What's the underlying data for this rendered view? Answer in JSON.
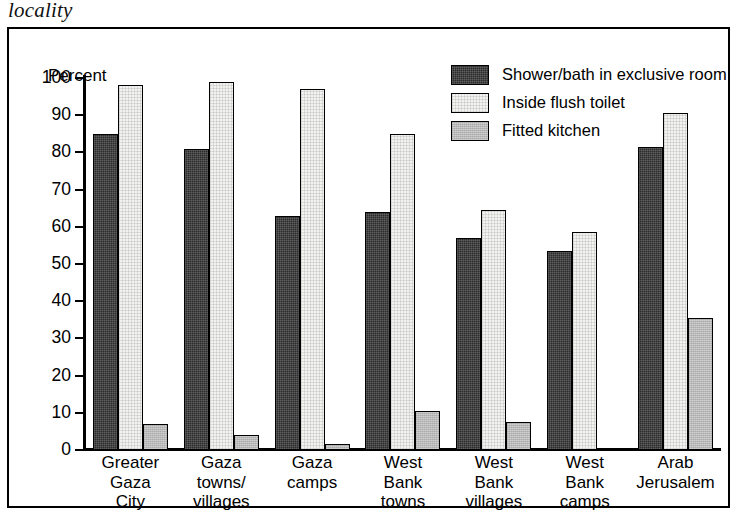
{
  "title_fragment": "locality",
  "axis": {
    "y_caption": "Percent",
    "y_ticks": [
      "100",
      "90",
      "80",
      "70",
      "60",
      "50",
      "40",
      "30",
      "20",
      "10",
      "0"
    ]
  },
  "legend": {
    "items": [
      {
        "label": "Shower/bath in exclusive room",
        "swatch": "dark"
      },
      {
        "label": "Inside flush toilet",
        "swatch": "white"
      },
      {
        "label": "Fitted kitchen",
        "swatch": "grey"
      }
    ]
  },
  "categories": [
    {
      "lines": [
        "Greater",
        "Gaza",
        "City"
      ]
    },
    {
      "lines": [
        "Gaza",
        "towns/",
        "villages"
      ]
    },
    {
      "lines": [
        "Gaza",
        "camps"
      ]
    },
    {
      "lines": [
        "West",
        "Bank",
        "towns"
      ]
    },
    {
      "lines": [
        "West",
        "Bank",
        "villages"
      ]
    },
    {
      "lines": [
        "West",
        "Bank",
        "camps"
      ]
    },
    {
      "lines": [
        "Arab",
        "Jerusalem"
      ]
    }
  ],
  "chart_data": {
    "type": "bar",
    "title": "locality",
    "xlabel": "",
    "ylabel": "Percent",
    "ylim": [
      0,
      100
    ],
    "ytick_step": 10,
    "grid": false,
    "legend_position": "top-right",
    "categories": [
      "Greater Gaza City",
      "Gaza towns/villages",
      "Gaza camps",
      "West Bank towns",
      "West Bank villages",
      "West Bank camps",
      "Arab Jerusalem"
    ],
    "series": [
      {
        "name": "Shower/bath in exclusive room",
        "color": "#2b2b2b",
        "values": [
          85,
          81,
          63,
          64,
          57,
          53.5,
          81.5
        ]
      },
      {
        "name": "Inside flush toilet",
        "color": "#f2f2f0",
        "values": [
          98,
          99,
          97,
          85,
          64.5,
          58.5,
          90.5
        ]
      },
      {
        "name": "Fitted kitchen",
        "color": "#b9b9b9",
        "values": [
          7,
          4,
          1.5,
          10.5,
          7.5,
          0.6,
          35.5
        ]
      }
    ]
  }
}
